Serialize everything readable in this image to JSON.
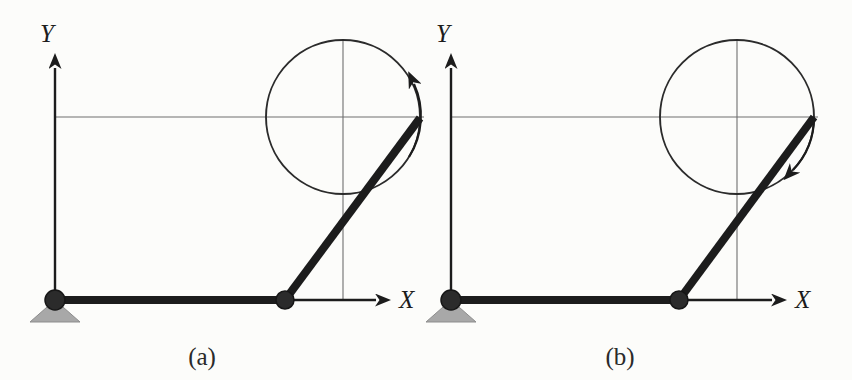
{
  "figure": {
    "background_color": "#fcfcfa",
    "ink_color": "#1c1c1c",
    "thin_line_color": "#6e6e6e",
    "support_fill_color": "#a8a8a8",
    "joint_fill_color": "#2b2b2b",
    "width": 852,
    "height": 380
  },
  "panels": [
    {
      "id": "a",
      "caption": "(",
      "caption_letter": "a",
      "caption_close": ")",
      "caption_full": "(a)",
      "caption_x": 202,
      "caption_y": 365,
      "axes": {
        "origin": {
          "x": 55,
          "y": 300
        },
        "x_axis": {
          "label": "X",
          "label_x": 399,
          "label_y": 308,
          "end_x": 392,
          "arrow_tip_x": 392
        },
        "y_axis": {
          "label": "Y",
          "label_x": 47,
          "label_y": 42,
          "end_y": 52,
          "arrow_tip_y": 52
        }
      },
      "grid": {
        "horizontal_line_y": 117,
        "horizontal_line_x_start": 55,
        "horizontal_line_x_end": 424,
        "vertical_line_x": 343,
        "vertical_line_y_start": 40,
        "vertical_line_y_end": 300
      },
      "circle": {
        "cx": 343,
        "cy": 117,
        "r": 77
      },
      "ground_joint": {
        "x": 55,
        "y": 300,
        "r": 10
      },
      "middle_joint": {
        "x": 285,
        "y": 300,
        "r": 9
      },
      "link_ground": {
        "x1": 55,
        "y1": 300,
        "x2": 285,
        "y2": 300
      },
      "link_crank": {
        "x1": 285,
        "y1": 300,
        "x2": 420,
        "y2": 118
      },
      "support_triangle": {
        "cx": 55,
        "y_top": 300,
        "half_width": 25,
        "height": 22
      },
      "rotation_arrow": {
        "direction": "counterclockwise",
        "sweep_start_deg": 20,
        "sweep_end_deg": 95,
        "arrow_angle_deg": 33,
        "description": "ccw-rotation-arrow"
      }
    },
    {
      "id": "b",
      "caption": "(",
      "caption_letter": "b",
      "caption_close": ")",
      "caption_full": "(b)",
      "caption_x": 620,
      "caption_y": 365,
      "axes": {
        "origin": {
          "x": 451,
          "y": 300
        },
        "x_axis": {
          "label": "X",
          "label_x": 795,
          "label_y": 308,
          "end_x": 788,
          "arrow_tip_x": 788
        },
        "y_axis": {
          "label": "Y",
          "label_x": 443,
          "label_y": 42,
          "end_y": 52,
          "arrow_tip_y": 52
        }
      },
      "grid": {
        "horizontal_line_y": 117,
        "horizontal_line_x_start": 451,
        "horizontal_line_x_end": 818,
        "vertical_line_x": 737,
        "vertical_line_y_start": 40,
        "vertical_line_y_end": 300
      },
      "circle": {
        "cx": 737,
        "cy": 117,
        "r": 77
      },
      "ground_joint": {
        "x": 451,
        "y": 300,
        "r": 10
      },
      "middle_joint": {
        "x": 679,
        "y": 300,
        "r": 9
      },
      "link_ground": {
        "x1": 451,
        "y1": 300,
        "x2": 679,
        "y2": 300
      },
      "link_crank": {
        "x1": 679,
        "y1": 300,
        "x2": 814,
        "y2": 117
      },
      "support_triangle": {
        "cx": 451,
        "y_top": 300,
        "half_width": 25,
        "height": 22
      },
      "rotation_arrow": {
        "direction": "clockwise",
        "sweep_start_deg": 0,
        "sweep_end_deg": -50,
        "arrow_angle_deg": -38,
        "description": "cw-rotation-arrow"
      }
    }
  ]
}
